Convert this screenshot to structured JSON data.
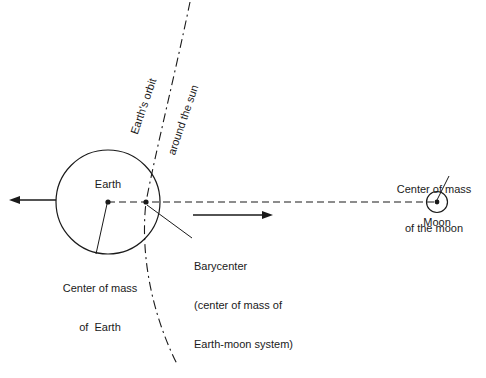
{
  "diagram": {
    "background_color": "#ffffff",
    "stroke_color": "#1a1a1a",
    "labels": {
      "earth": "Earth",
      "moon": "Moon",
      "earth_center_of_mass_line1": "Center of mass",
      "earth_center_of_mass_line2": "of  Earth",
      "barycenter_line1": "Barycenter",
      "barycenter_line2": "(center of mass of",
      "barycenter_line3": "Earth-moon system)",
      "moon_center_of_mass_line1": "Center of mass",
      "moon_center_of_mass_line2": "of the moon",
      "orbit_line1": "Earth's orbit",
      "orbit_line2": "around the sun"
    },
    "icons": {
      "earth_body": "earth-circle",
      "moon_body": "moon-circle",
      "earth_com_marker": "center-of-mass-dot",
      "barycenter_marker": "barycenter-dot",
      "moon_com_marker": "center-of-mass-dot",
      "left_arrow": "left-arrow",
      "right_arrow": "right-arrow",
      "orbit_path": "dash-dot-orbit-curve",
      "earth_moon_axis": "dashed-axis-line"
    },
    "geometry": {
      "earth_center_x": 108,
      "earth_center_y": 202,
      "earth_radius": 52,
      "barycenter_x": 146,
      "barycenter_y": 202,
      "moon_center_x": 437,
      "moon_center_y": 202,
      "moon_radius": 10
    }
  }
}
